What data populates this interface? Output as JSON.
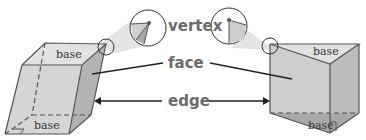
{
  "diagram": {
    "labels": {
      "vertex": "vertex",
      "face": "face",
      "edge": "edge"
    },
    "left_prism": {
      "type": "oblique rectangular prism",
      "top_label": "base",
      "bottom_label": "base"
    },
    "right_prism": {
      "type": "right triangular prism",
      "top_label": "base",
      "bottom_label": "base"
    },
    "colors": {
      "face_light": "#d9d9d9",
      "face_mid": "#c4c4c4",
      "face_dark": "#a8a8a8",
      "outline": "#555555",
      "label": "#6b6b6b",
      "magnifier_cone": "#e4e4e4"
    }
  }
}
